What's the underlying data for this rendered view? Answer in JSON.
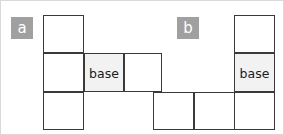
{
  "diagram": {
    "background_color": "#ffffff",
    "border_color": "#d9d9d9",
    "cell_stroke_color": "#3a3a3a",
    "cell_fill_color": "#ffffff",
    "base_fill_color": "#f2f2f2",
    "badge_fill_color": "#a0a0a0",
    "badge_text_color": "#ffffff",
    "cell_size": 40,
    "figures": [
      {
        "badge": "a",
        "badge_x": 10,
        "badge_y": 16,
        "cells": [
          {
            "name": "cell-a-top",
            "label": "",
            "x": 42,
            "y": 14,
            "w": 41,
            "h": 38,
            "shaded": false
          },
          {
            "name": "cell-a-middle-left",
            "label": "",
            "x": 42,
            "y": 52,
            "w": 41,
            "h": 39,
            "shaded": false
          },
          {
            "name": "cell-a-bottom",
            "label": "",
            "x": 42,
            "y": 91,
            "w": 41,
            "h": 38,
            "shaded": false
          },
          {
            "name": "cell-a-base",
            "label": "base",
            "x": 83,
            "y": 52,
            "w": 40,
            "h": 39,
            "shaded": true
          },
          {
            "name": "cell-a-middle-right",
            "label": "",
            "x": 123,
            "y": 52,
            "w": 38,
            "h": 39,
            "shaded": false
          }
        ]
      },
      {
        "badge": "b",
        "badge_x": 176,
        "badge_y": 16,
        "cells": [
          {
            "name": "cell-b-top",
            "label": "",
            "x": 233,
            "y": 14,
            "w": 41,
            "h": 38,
            "shaded": false
          },
          {
            "name": "cell-b-base",
            "label": "base",
            "x": 233,
            "y": 52,
            "w": 41,
            "h": 39,
            "shaded": true
          },
          {
            "name": "cell-b-bottom-left",
            "label": "",
            "x": 152,
            "y": 91,
            "w": 41,
            "h": 38,
            "shaded": false
          },
          {
            "name": "cell-b-bottom-middle",
            "label": "",
            "x": 193,
            "y": 91,
            "w": 41,
            "h": 38,
            "shaded": false
          },
          {
            "name": "cell-b-bottom-right",
            "label": "",
            "x": 233,
            "y": 91,
            "w": 41,
            "h": 38,
            "shaded": false
          }
        ]
      }
    ]
  }
}
